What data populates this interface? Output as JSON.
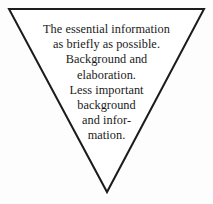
{
  "diagram": {
    "name": "inverted-pyramid-triangle",
    "shape": "inverted-triangle",
    "stroke_color": "#1c1c1c",
    "fill_color": "#ffffff",
    "background_color": "#fdfdfd",
    "text_color": "#1a1a1a",
    "stroke_width": 2,
    "vertices": {
      "top_left": [
        9,
        9
      ],
      "top_right": [
        204,
        9
      ],
      "bottom_apex": [
        107,
        192
      ]
    },
    "lines": [
      "The essential information",
      "as briefly as possible.",
      "Background and",
      "elaboration.",
      "Less important",
      "background",
      "and infor-",
      "mation."
    ]
  }
}
